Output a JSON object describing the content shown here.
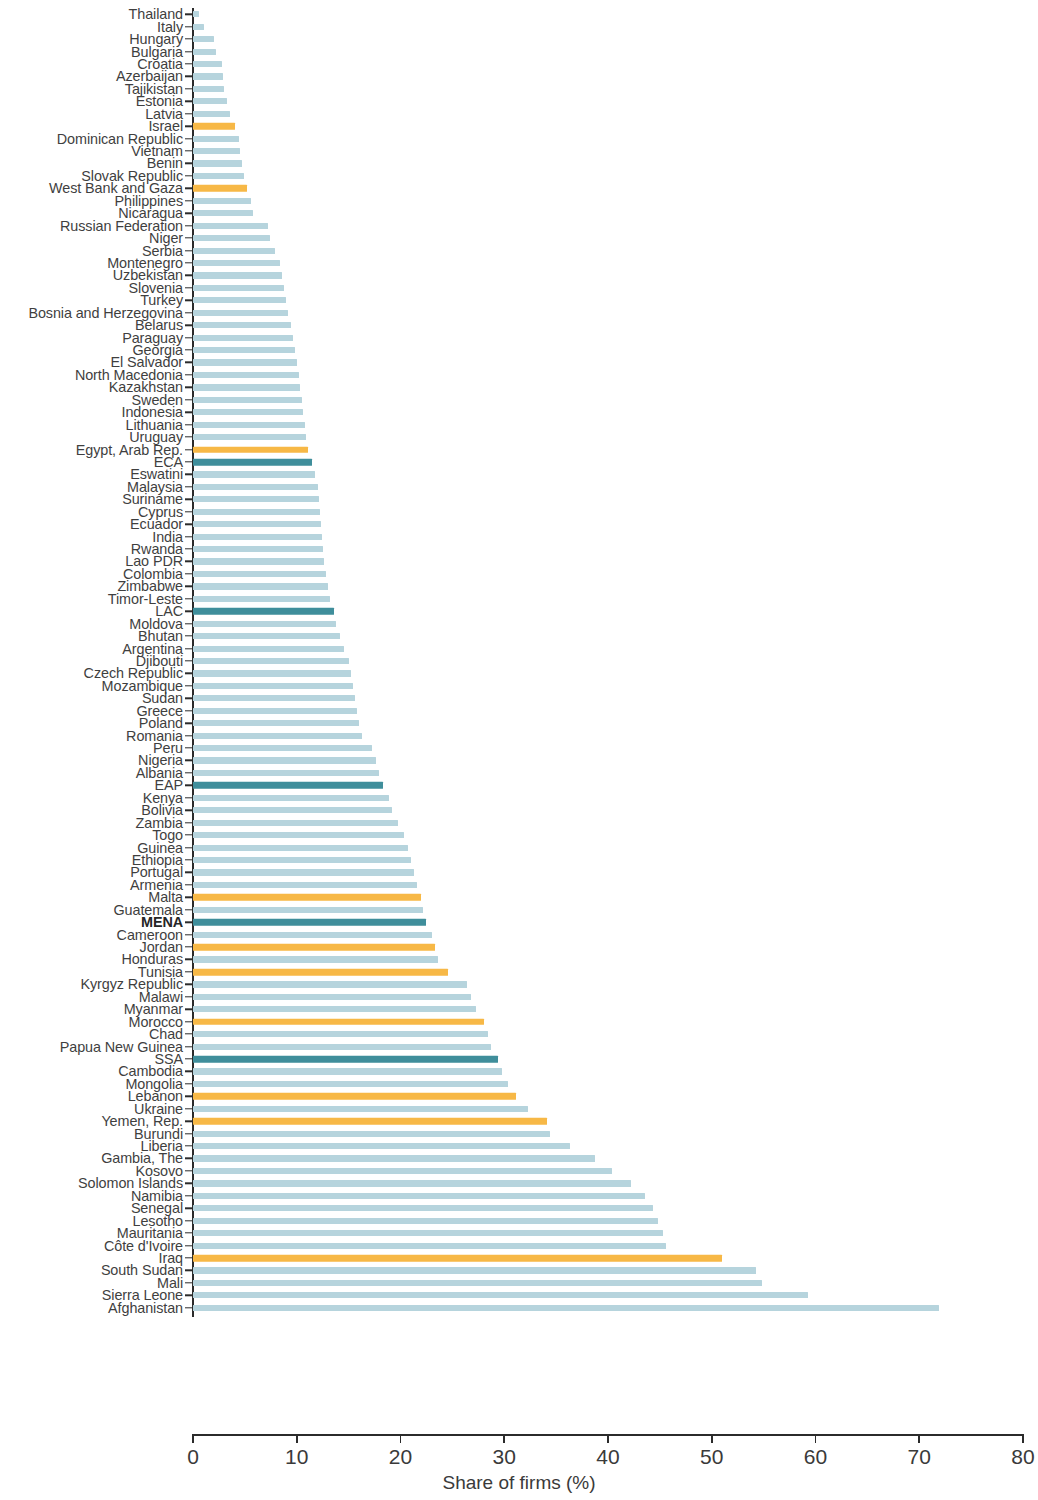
{
  "chart_data": {
    "type": "bar",
    "orientation": "horizontal",
    "title": "",
    "xlabel": "Share of firms (%)",
    "ylabel": "",
    "xlim": [
      0,
      80
    ],
    "xticks": [
      0,
      10,
      20,
      30,
      40,
      50,
      60,
      70,
      80
    ],
    "xtick_labels": [
      "0",
      "10",
      "20",
      "30",
      "40",
      "50",
      "60",
      "70",
      "80"
    ],
    "grid": false,
    "legend": [],
    "colors": {
      "default_bar": "#b6d4dd",
      "highlight_mena_economy": "#f7b846",
      "region_aggregate": "#3f8e9b",
      "axis": "#2b2b2b",
      "text": "#3a3a3a"
    },
    "series_name": "Share of firms (%)",
    "categories": [
      "Thailand",
      "Italy",
      "Hungary",
      "Bulgaria",
      "Croatia",
      "Azerbaijan",
      "Tajikistan",
      "Estonia",
      "Latvia",
      "Israel",
      "Dominican Republic",
      "Vietnam",
      "Benin",
      "Slovak Republic",
      "West Bank and Gaza",
      "Philippines",
      "Nicaragua",
      "Russian Federation",
      "Niger",
      "Serbia",
      "Montenegro",
      "Uzbekistan",
      "Slovenia",
      "Turkey",
      "Bosnia and Herzegovina",
      "Belarus",
      "Paraguay",
      "Georgia",
      "El Salvador",
      "North Macedonia",
      "Kazakhstan",
      "Sweden",
      "Indonesia",
      "Lithuania",
      "Uruguay",
      "Egypt, Arab Rep.",
      "ECA",
      "Eswatini",
      "Malaysia",
      "Suriname",
      "Cyprus",
      "Ecuador",
      "India",
      "Rwanda",
      "Lao PDR",
      "Colombia",
      "Zimbabwe",
      "Timor-Leste",
      "LAC",
      "Moldova",
      "Bhutan",
      "Argentina",
      "Djibouti",
      "Czech Republic",
      "Mozambique",
      "Sudan",
      "Greece",
      "Poland",
      "Romania",
      "Peru",
      "Nigeria",
      "Albania",
      "EAP",
      "Kenya",
      "Bolivia",
      "Zambia",
      "Togo",
      "Guinea",
      "Ethiopia",
      "Portugal",
      "Armenia",
      "Malta",
      "Guatemala",
      "MENA",
      "Cameroon",
      "Jordan",
      "Honduras",
      "Tunisia",
      "Kyrgyz Republic",
      "Malawi",
      "Myanmar",
      "Morocco",
      "Chad",
      "Papua New Guinea",
      "SSA",
      "Cambodia",
      "Mongolia",
      "Lebanon",
      "Ukraine",
      "Yemen, Rep.",
      "Burundi",
      "Liberia",
      "Gambia, The",
      "Kosovo",
      "Solomon Islands",
      "Namibia",
      "Senegal",
      "Lesotho",
      "Mauritania",
      "Côte d'Ivoire",
      "Iraq",
      "South Sudan",
      "Mali",
      "Sierra Leone",
      "Afghanistan"
    ],
    "values": [
      0.6,
      1.1,
      2.0,
      2.2,
      2.8,
      2.9,
      3.0,
      3.3,
      3.6,
      4.0,
      4.4,
      4.5,
      4.7,
      4.9,
      5.2,
      5.6,
      5.8,
      7.2,
      7.4,
      7.9,
      8.4,
      8.6,
      8.8,
      9.0,
      9.2,
      9.4,
      9.6,
      9.8,
      10.0,
      10.2,
      10.3,
      10.5,
      10.6,
      10.8,
      10.9,
      11.1,
      11.5,
      11.8,
      12.0,
      12.1,
      12.2,
      12.3,
      12.4,
      12.5,
      12.6,
      12.8,
      13.0,
      13.2,
      13.6,
      13.8,
      14.2,
      14.6,
      15.0,
      15.2,
      15.4,
      15.6,
      15.8,
      16.0,
      16.3,
      17.3,
      17.6,
      17.9,
      18.3,
      18.9,
      19.2,
      19.8,
      20.3,
      20.7,
      21.0,
      21.3,
      21.6,
      22.0,
      22.2,
      22.5,
      23.0,
      23.3,
      23.6,
      24.6,
      26.4,
      26.8,
      27.3,
      28.0,
      28.4,
      28.7,
      29.4,
      29.8,
      30.4,
      31.1,
      32.3,
      34.1,
      34.4,
      36.3,
      38.7,
      40.4,
      42.2,
      43.6,
      44.3,
      44.8,
      45.3,
      45.6,
      51.0,
      54.3,
      54.8,
      59.3,
      71.9
    ],
    "bar_styles": [
      "light",
      "light",
      "light",
      "light",
      "light",
      "light",
      "light",
      "light",
      "light",
      "orange",
      "light",
      "light",
      "light",
      "light",
      "orange",
      "light",
      "light",
      "light",
      "light",
      "light",
      "light",
      "light",
      "light",
      "light",
      "light",
      "light",
      "light",
      "light",
      "light",
      "light",
      "light",
      "light",
      "light",
      "light",
      "light",
      "orange",
      "teal",
      "light",
      "light",
      "light",
      "light",
      "light",
      "light",
      "light",
      "light",
      "light",
      "light",
      "light",
      "teal",
      "light",
      "light",
      "light",
      "light",
      "light",
      "light",
      "light",
      "light",
      "light",
      "light",
      "light",
      "light",
      "light",
      "teal",
      "light",
      "light",
      "light",
      "light",
      "light",
      "light",
      "light",
      "light",
      "orange",
      "light",
      "teal",
      "light",
      "orange",
      "light",
      "orange",
      "light",
      "light",
      "light",
      "orange",
      "light",
      "light",
      "teal",
      "light",
      "light",
      "orange",
      "light",
      "orange",
      "light",
      "light",
      "light",
      "light",
      "light",
      "light",
      "light",
      "light",
      "light",
      "light",
      "orange",
      "light",
      "light",
      "light",
      "light"
    ],
    "bold_labels": [
      "MENA"
    ]
  }
}
